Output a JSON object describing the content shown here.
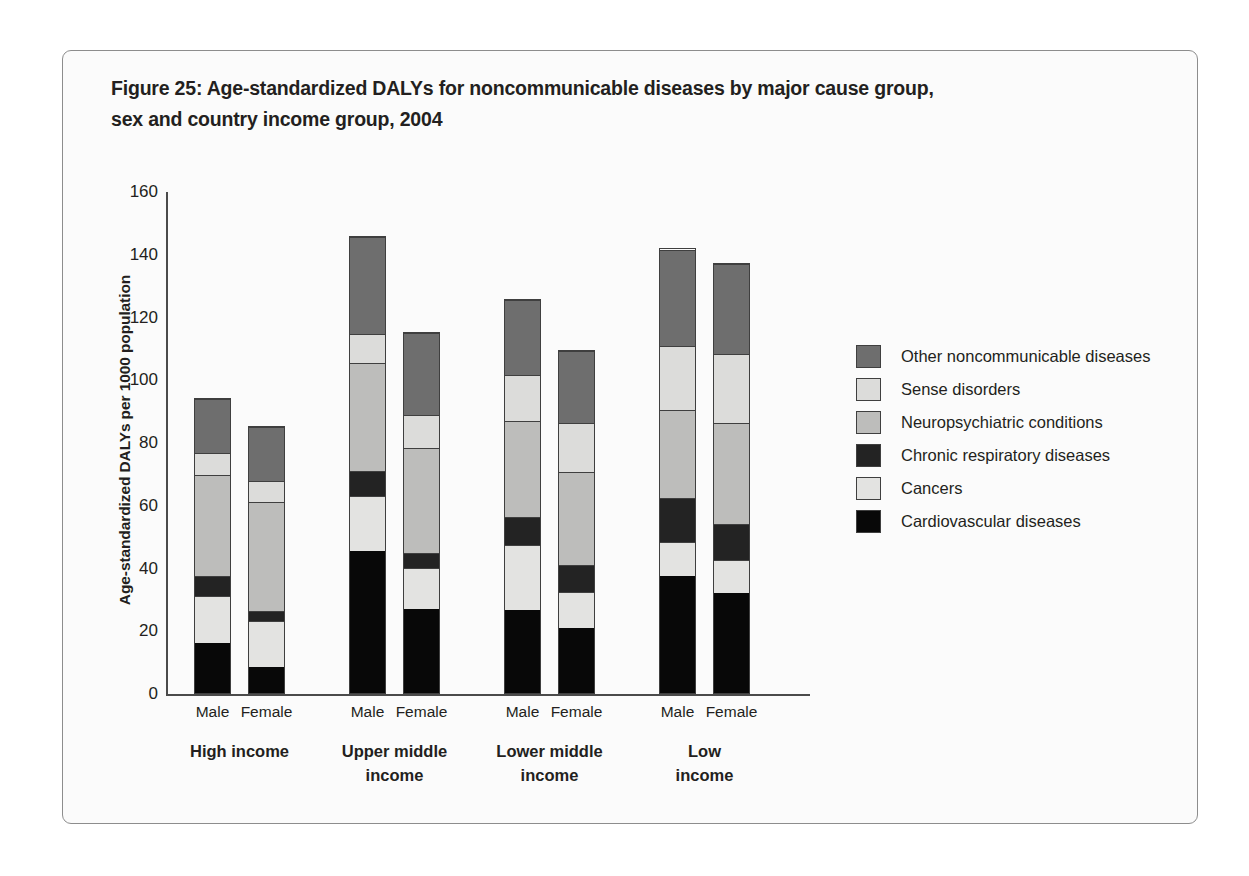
{
  "figure": {
    "title_line1": "Figure 25: Age-standardized DALYs for noncommunicable diseases by major cause group,",
    "title_line2": "sex and country income group, 2004"
  },
  "chart_data": {
    "type": "bar",
    "stacked": true,
    "title": "Figure 25: Age-standardized DALYs for noncommunicable diseases by major cause group, sex and country income group, 2004",
    "xlabel": "",
    "ylabel": "Age-standardized DALYs per 1000 population",
    "ylim": [
      0,
      160
    ],
    "yticks": [
      0,
      20,
      40,
      60,
      80,
      100,
      120,
      140,
      160
    ],
    "ytick_labels": [
      "0",
      "20",
      "40",
      "60",
      "80",
      "100",
      "120",
      "140",
      "160"
    ],
    "grid": false,
    "legend_position": "right",
    "group_labels": [
      "High income",
      "Upper middle income",
      "Lower middle income",
      "Low income"
    ],
    "group_label_lines": [
      [
        "High income"
      ],
      [
        "Upper middle",
        "income"
      ],
      [
        "Lower middle",
        "income"
      ],
      [
        "Low",
        "income"
      ]
    ],
    "sex_labels": [
      "Male",
      "Female"
    ],
    "categories": [
      "High income Male",
      "High income Female",
      "Upper middle income Male",
      "Upper middle income Female",
      "Lower middle income Male",
      "Lower middle income Female",
      "Low income Male",
      "Low income Female"
    ],
    "series": [
      {
        "name": "Cardiovascular diseases",
        "color": "#080808",
        "values": [
          16.0,
          8.5,
          45.5,
          27.0,
          26.5,
          21.0,
          37.5,
          32.0
        ]
      },
      {
        "name": "Cancers",
        "color": "#e3e3e1",
        "values": [
          15.0,
          14.5,
          17.5,
          13.0,
          21.0,
          11.5,
          11.0,
          10.5
        ]
      },
      {
        "name": "Chronic respiratory diseases",
        "color": "#232323",
        "values": [
          6.5,
          3.5,
          8.0,
          5.0,
          9.0,
          8.5,
          14.0,
          11.5
        ]
      },
      {
        "name": "Neuropsychiatric conditions",
        "color": "#bdbdbb",
        "values": [
          32.5,
          35.0,
          34.5,
          33.5,
          30.5,
          30.0,
          28.0,
          32.5
        ]
      },
      {
        "name": "Sense disorders",
        "color": "#dcdcda",
        "values": [
          7.0,
          6.5,
          9.5,
          10.5,
          15.0,
          15.5,
          20.5,
          22.0
        ]
      },
      {
        "name": "Other noncommunicable diseases",
        "color": "#6e6e6e",
        "values": [
          17.5,
          17.5,
          31.0,
          26.5,
          24.0,
          23.0,
          31.0,
          29.0
        ]
      }
    ],
    "totals": [
      94.5,
      85.5,
      146.0,
      115.5,
      126.0,
      109.5,
      142.0,
      137.5
    ]
  },
  "legend": {
    "items": [
      {
        "label": "Other noncommunicable diseases",
        "color": "#6e6e6e"
      },
      {
        "label": "Sense disorders",
        "color": "#dcdcda"
      },
      {
        "label": "Neuropsychiatric conditions",
        "color": "#bdbdbb"
      },
      {
        "label": "Chronic respiratory diseases",
        "color": "#232323"
      },
      {
        "label": "Cancers",
        "color": "#e3e3e1"
      },
      {
        "label": "Cardiovascular diseases",
        "color": "#080808"
      }
    ]
  }
}
